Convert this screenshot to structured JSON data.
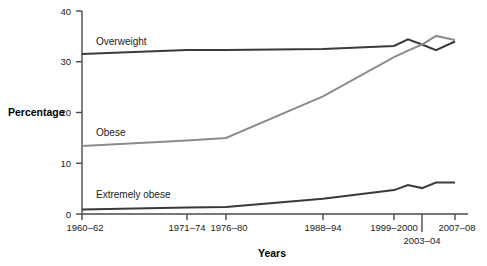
{
  "chart_data": {
    "type": "line",
    "title": "",
    "xlabel": "Years",
    "ylabel": "Percentage",
    "ylim": [
      0,
      40
    ],
    "yticks": [
      0,
      10,
      20,
      30,
      40
    ],
    "grid": false,
    "legend_position": "inline-labels",
    "categories": [
      "1960–62",
      "1971–74",
      "1976–80",
      "1988–94",
      "1999–2000",
      "2001–02",
      "2003–04",
      "2005–06",
      "2007–08"
    ],
    "x_tick_labels": [
      "1960–62",
      "1971–74",
      "1976–80",
      "1988–94",
      "1999–2000",
      "2003–04",
      "2007–08"
    ],
    "series": [
      {
        "name": "Overweight",
        "color": "#3a3a3a",
        "values": [
          31.5,
          32.3,
          32.3,
          32.5,
          33.1,
          34.4,
          33.4,
          32.3,
          34.0
        ]
      },
      {
        "name": "Obese",
        "color": "#8c8c8c",
        "values": [
          13.4,
          14.5,
          15.0,
          23.2,
          30.9,
          32.2,
          33.4,
          35.1,
          34.3
        ]
      },
      {
        "name": "Extremely obese",
        "color": "#3a3a3a",
        "values": [
          0.9,
          1.3,
          1.4,
          3.0,
          4.7,
          5.7,
          5.1,
          6.2,
          6.2
        ]
      }
    ]
  },
  "axes": {
    "y_title": "Percentage",
    "x_title": "Years",
    "y_tick_labels": [
      "40",
      "30",
      "20",
      "10",
      "0"
    ],
    "x_tick_labels": [
      "1960–62",
      "1971–74",
      "1976–80",
      "1988–94",
      "1999–2000",
      "2003–04",
      "2007–08"
    ]
  },
  "series_labels": {
    "overweight": "Overweight",
    "obese": "Obese",
    "extremely_obese": "Extremely obese"
  },
  "clipped_header": ""
}
